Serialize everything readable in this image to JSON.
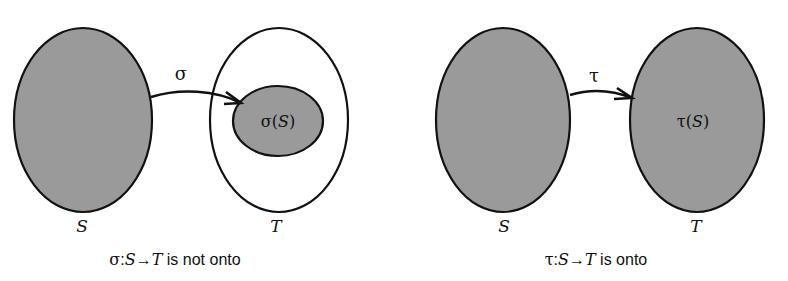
{
  "colors": {
    "set_fill": "#9a9a9a",
    "stroke": "#111111",
    "background": "#ffffff"
  },
  "panels": [
    {
      "id": "not-onto",
      "map_symbol": "σ",
      "domain_label": "S",
      "codomain_label": "T",
      "image_label": {
        "func": "σ",
        "open": "(",
        "arg": "S",
        "close": ")"
      },
      "caption": {
        "func": "σ",
        "colon": ":",
        "domain": "S",
        "arrow": "→",
        "codomain": "T",
        "text": " is not onto"
      }
    },
    {
      "id": "onto",
      "map_symbol": "τ",
      "domain_label": "S",
      "codomain_label": "T",
      "image_label": {
        "func": "τ",
        "open": "(",
        "arg": "S",
        "close": ")"
      },
      "caption": {
        "func": "τ",
        "colon": ":",
        "domain": "S",
        "arrow": "→",
        "codomain": "T",
        "text": " is onto"
      }
    }
  ]
}
